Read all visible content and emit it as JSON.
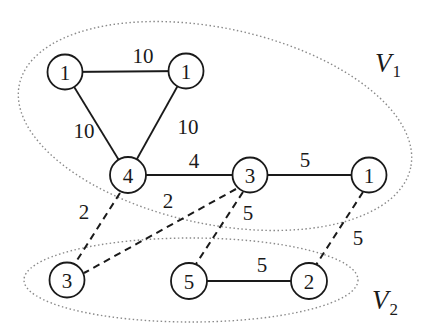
{
  "diagram": {
    "type": "weighted-graph-partition",
    "partitions": [
      {
        "id": "V1",
        "label": "V",
        "subscript": "1"
      },
      {
        "id": "V2",
        "label": "V",
        "subscript": "2"
      }
    ],
    "nodes": [
      {
        "id": "a",
        "weight": "1",
        "partition": "V1"
      },
      {
        "id": "b",
        "weight": "1",
        "partition": "V1"
      },
      {
        "id": "c",
        "weight": "4",
        "partition": "V1"
      },
      {
        "id": "d",
        "weight": "3",
        "partition": "V1"
      },
      {
        "id": "e",
        "weight": "1",
        "partition": "V1"
      },
      {
        "id": "f",
        "weight": "3",
        "partition": "V2"
      },
      {
        "id": "g",
        "weight": "5",
        "partition": "V2"
      },
      {
        "id": "h",
        "weight": "2",
        "partition": "V2"
      }
    ],
    "edges": [
      {
        "from": "a",
        "to": "b",
        "weight": "10",
        "style": "solid"
      },
      {
        "from": "a",
        "to": "c",
        "weight": "10",
        "style": "solid"
      },
      {
        "from": "b",
        "to": "c",
        "weight": "10",
        "style": "solid"
      },
      {
        "from": "c",
        "to": "d",
        "weight": "4",
        "style": "solid"
      },
      {
        "from": "d",
        "to": "e",
        "weight": "5",
        "style": "solid"
      },
      {
        "from": "c",
        "to": "f",
        "weight": "2",
        "style": "dashed"
      },
      {
        "from": "d",
        "to": "f",
        "weight": "2",
        "style": "dashed"
      },
      {
        "from": "d",
        "to": "g",
        "weight": "5",
        "style": "dashed"
      },
      {
        "from": "e",
        "to": "h",
        "weight": "5",
        "style": "dashed"
      },
      {
        "from": "g",
        "to": "h",
        "weight": "5",
        "style": "solid"
      }
    ]
  }
}
